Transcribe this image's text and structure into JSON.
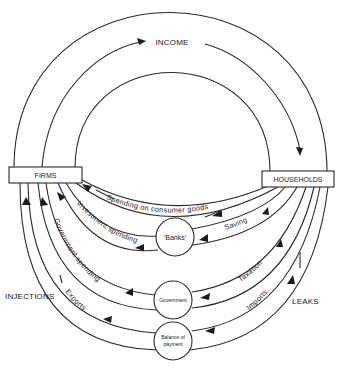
{
  "top_flow": {
    "label": "INCOME"
  },
  "nodes": {
    "firms": "FIRMS",
    "households": "HOUSEHOLDS",
    "banks": "'Banks'",
    "government": "Government",
    "balance_line1": "Balance of",
    "balance_line2": "payment"
  },
  "flows": {
    "consumer": "Spending on consumer goods",
    "investment": "Investment spending",
    "gov_spending": "Government spending",
    "exports": "Exports",
    "saving": "Saving",
    "taxation": "Taxation",
    "imports": "Imports"
  },
  "side_labels": {
    "injections": "INJECTIONS",
    "leaks": "LEAKS"
  },
  "colors": {
    "ink": "#2a2a2a",
    "background": "#ffffff"
  }
}
